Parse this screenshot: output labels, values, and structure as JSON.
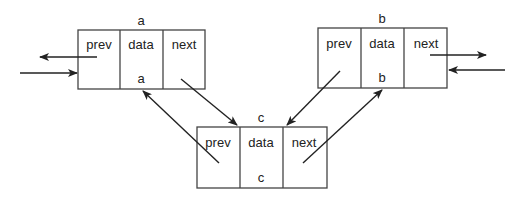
{
  "diagram": {
    "type": "doubly-linked-list-insertion",
    "field_labels": [
      "prev",
      "data",
      "next"
    ],
    "nodes": [
      {
        "id": "a",
        "name": "a",
        "data_value": "a",
        "x": 78,
        "y": 30,
        "w": 127,
        "h": 59
      },
      {
        "id": "b",
        "name": "b",
        "data_value": "b",
        "x": 318,
        "y": 28,
        "w": 129,
        "h": 60
      },
      {
        "id": "c",
        "name": "c",
        "data_value": "c",
        "x": 197,
        "y": 127,
        "w": 130,
        "h": 61
      }
    ],
    "edges": [
      {
        "from": "a.prev",
        "to": "left-outside",
        "label": ""
      },
      {
        "from": "left-outside",
        "to": "a",
        "label": ""
      },
      {
        "from": "b.next",
        "to": "right-outside",
        "label": ""
      },
      {
        "from": "right-outside",
        "to": "b",
        "label": ""
      },
      {
        "from": "a.next",
        "to": "c",
        "label": ""
      },
      {
        "from": "c.prev",
        "to": "a",
        "label": ""
      },
      {
        "from": "b.prev",
        "to": "c",
        "label": ""
      },
      {
        "from": "c.next",
        "to": "b",
        "label": ""
      }
    ]
  },
  "labels": {
    "a_name": "a",
    "a_prev": "prev",
    "a_data": "data",
    "a_next": "next",
    "a_value": "a",
    "b_name": "b",
    "b_prev": "prev",
    "b_data": "data",
    "b_next": "next",
    "b_value": "b",
    "c_name": "c",
    "c_prev": "prev",
    "c_data": "data",
    "c_next": "next",
    "c_value": "c"
  }
}
